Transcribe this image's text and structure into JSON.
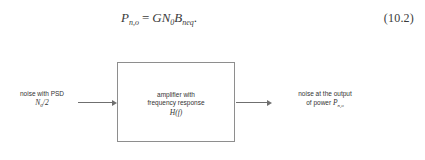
{
  "equation": {
    "lhs_symbol": "P",
    "lhs_subscript": "n,o",
    "operator": "=",
    "rhs_g": "G",
    "rhs_n": "N",
    "rhs_n_subscript": "0",
    "rhs_b": "B",
    "rhs_b_subscript": "neq",
    "terminator": ".",
    "number": "(10.2)"
  },
  "diagram": {
    "block": {
      "line1": "amplifier with",
      "line2": "frequency response",
      "line3": "H(f)"
    },
    "input": {
      "line1": "noise with PSD",
      "math_symbol": "N",
      "math_subscript": "0",
      "math_suffix": "/2"
    },
    "output": {
      "line1": "noise at the output",
      "line2_prefix": "of power ",
      "math_symbol": "P",
      "math_subscript": "n,o"
    },
    "arrow_in_name": "input-arrow",
    "arrow_out_name": "output-arrow"
  },
  "colors": {
    "background": "#ffffff",
    "text": "#333333",
    "line": "#6f6f6f",
    "block_border": "#8e8e8e"
  }
}
